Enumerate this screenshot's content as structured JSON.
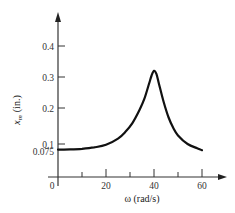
{
  "chart_data": {
    "type": "line",
    "title": "",
    "xlabel": "ω (rad/s)",
    "ylabel": "x_m (in.)",
    "ylabel_main": "x",
    "ylabel_sub": "m",
    "ylabel_unit": "(in.)",
    "xlim": [
      0,
      66
    ],
    "ylim": [
      0,
      0.45
    ],
    "grid": false,
    "legend": null,
    "x_ticks": [
      {
        "value": 0,
        "label": "0"
      },
      {
        "value": 10,
        "label": ""
      },
      {
        "value": 20,
        "label": "20"
      },
      {
        "value": 30,
        "label": ""
      },
      {
        "value": 40,
        "label": "40"
      },
      {
        "value": 50,
        "label": ""
      },
      {
        "value": 60,
        "label": "60"
      }
    ],
    "y_ticks": [
      {
        "value": 0.075,
        "label": "0.075"
      },
      {
        "value": 0.1,
        "label": "0.1"
      },
      {
        "value": 0.2,
        "label": "0.2"
      },
      {
        "value": 0.3,
        "label": "0.3"
      },
      {
        "value": 0.4,
        "label": "0.4"
      }
    ],
    "series": [
      {
        "name": "amplitude",
        "x": [
          0,
          5,
          10,
          15,
          20,
          25,
          28,
          31,
          34,
          36,
          38,
          39,
          40,
          41,
          42,
          44,
          46,
          48,
          50,
          54,
          58,
          60
        ],
        "y": [
          0.08,
          0.081,
          0.083,
          0.088,
          0.097,
          0.115,
          0.133,
          0.158,
          0.195,
          0.23,
          0.28,
          0.305,
          0.32,
          0.31,
          0.28,
          0.22,
          0.175,
          0.145,
          0.124,
          0.1,
          0.085,
          0.078
        ]
      }
    ],
    "annotations": [
      {
        "text": "peak ≈ 0.32 at ω ≈ 40"
      }
    ]
  }
}
